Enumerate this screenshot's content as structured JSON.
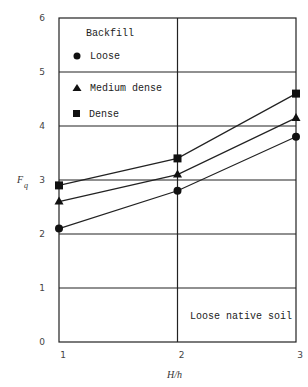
{
  "chart_data": {
    "type": "line",
    "title": "",
    "xlabel": "H/h",
    "ylabel": "F_q",
    "ylabel_main": "F",
    "ylabel_sub": "q",
    "x": [
      1,
      2,
      3
    ],
    "xticks": [
      "1",
      "2",
      "3"
    ],
    "yticks": [
      "0",
      "1",
      "2",
      "3",
      "4",
      "5",
      "6"
    ],
    "xlim": [
      1,
      3
    ],
    "ylim": [
      0,
      6
    ],
    "grid": true,
    "legend_title": "Backfill",
    "legend_position": "upper-left",
    "series": [
      {
        "name": "Loose",
        "marker": "circle",
        "values": [
          2.1,
          2.8,
          3.8
        ]
      },
      {
        "name": "Medium dense",
        "marker": "triangle",
        "values": [
          2.6,
          3.1,
          4.15
        ]
      },
      {
        "name": "Dense",
        "marker": "square",
        "values": [
          2.9,
          3.4,
          4.6
        ]
      }
    ],
    "annotations": [
      "Loose native soil"
    ]
  },
  "legend": {
    "title": "Backfill",
    "items": [
      "Loose",
      "Medium dense",
      "Dense"
    ]
  },
  "annotation": "Loose native soil",
  "colors": {
    "line": "#222222",
    "marker": "#111111",
    "text": "#333333"
  }
}
